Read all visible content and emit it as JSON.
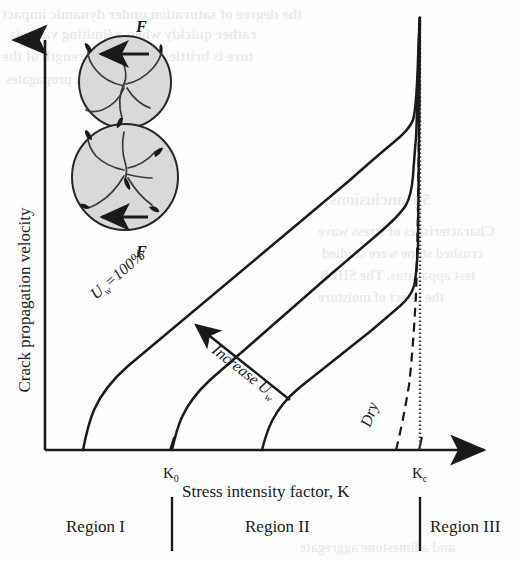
{
  "figure": {
    "type": "schematic-plot",
    "axes": {
      "y_label": "Crack propagation velocity",
      "x_label": "Stress intensity factor, K",
      "x_ticks": [
        {
          "id": "K0",
          "label": "K",
          "subscript": "0",
          "x_frac": 0.286
        },
        {
          "id": "Kc",
          "label": "K",
          "subscript": "c",
          "x_frac": 0.843
        }
      ]
    },
    "regions": [
      {
        "id": "region-1",
        "label": "Region I"
      },
      {
        "id": "region-2",
        "label": "Region II"
      },
      {
        "id": "region-3",
        "label": "Region III"
      }
    ],
    "curve_labels": {
      "saturated": "U",
      "saturated_sub": "w",
      "saturated_value": "=100%",
      "increase": "Increase U",
      "increase_sub": "w",
      "dry": "Dry"
    },
    "inset": {
      "force_top": "F",
      "force_bottom": "F",
      "description": "two grains in contact with radial cracks",
      "grain_fill": "#d9d9d9",
      "grain_stroke": "#262626"
    },
    "colors": {
      "ink": "#1a1a1a",
      "grain_fill": "#d9d9d9",
      "bleed": "#8b8b8b"
    }
  },
  "chart_data": {
    "type": "line",
    "title": "",
    "xlabel": "Stress intensity factor, K",
    "ylabel": "Crack propagation velocity",
    "xlim": [
      0,
      1
    ],
    "ylim": [
      0,
      1
    ],
    "grid": false,
    "legend": "inline-annotations",
    "xticks": [
      "K₀",
      "Kᴄ"
    ],
    "annotations": [
      {
        "text": "U_w =100%",
        "kind": "curve-label",
        "rotation": -45
      },
      {
        "text": "Increase U_w",
        "kind": "arrow-label",
        "rotation": 45
      },
      {
        "text": "Dry",
        "kind": "curve-label",
        "rotation": -68
      },
      {
        "text": "Region I",
        "kind": "region"
      },
      {
        "text": "Region II",
        "kind": "region"
      },
      {
        "text": "Region III",
        "kind": "region"
      }
    ],
    "asymptote": {
      "id": "Kc",
      "x_frac": 0.843,
      "style": "dotted"
    },
    "series": [
      {
        "name": "U_w = 100%",
        "style": "solid",
        "points": [
          [
            0.074,
            0.0
          ],
          [
            0.082,
            0.06
          ],
          [
            0.098,
            0.13
          ],
          [
            0.125,
            0.2
          ],
          [
            0.3,
            0.4
          ],
          [
            0.5,
            0.58
          ],
          [
            0.66,
            0.72
          ],
          [
            0.745,
            0.79
          ],
          [
            0.79,
            0.815
          ],
          [
            0.815,
            0.835
          ],
          [
            0.835,
            0.9
          ],
          [
            0.843,
            0.99
          ]
        ]
      },
      {
        "name": "intermediate saturation",
        "style": "solid",
        "points": [
          [
            0.286,
            0.0
          ],
          [
            0.295,
            0.05
          ],
          [
            0.312,
            0.11
          ],
          [
            0.345,
            0.175
          ],
          [
            0.5,
            0.32
          ],
          [
            0.64,
            0.45
          ],
          [
            0.75,
            0.545
          ],
          [
            0.8,
            0.585
          ],
          [
            0.826,
            0.6
          ],
          [
            0.838,
            0.66
          ],
          [
            0.843,
            0.99
          ]
        ]
      },
      {
        "name": "low saturation",
        "style": "solid",
        "points": [
          [
            0.462,
            0.0
          ],
          [
            0.472,
            0.045
          ],
          [
            0.492,
            0.1
          ],
          [
            0.535,
            0.165
          ],
          [
            0.655,
            0.255
          ],
          [
            0.745,
            0.315
          ],
          [
            0.795,
            0.345
          ],
          [
            0.822,
            0.37
          ],
          [
            0.836,
            0.5
          ],
          [
            0.843,
            0.99
          ]
        ]
      },
      {
        "name": "Dry",
        "style": "dashed",
        "points": [
          [
            0.745,
            0.0
          ],
          [
            0.775,
            0.1
          ],
          [
            0.8,
            0.22
          ],
          [
            0.818,
            0.38
          ],
          [
            0.83,
            0.56
          ],
          [
            0.838,
            0.78
          ],
          [
            0.842,
            0.99
          ]
        ]
      }
    ]
  },
  "background_text": {
    "note": "faint mirrored bleed-through from reverse page",
    "lines": [
      {
        "text": "the degree of saturation under dynamic impact",
        "x": 2,
        "y": 6,
        "size": 15
      },
      {
        "text": "rather quickly when a limiting value is",
        "x": 10,
        "y": 26,
        "size": 15
      },
      {
        "text": "ture is brittle. The shear strength of the",
        "x": 2,
        "y": 48,
        "size": 15
      },
      {
        "text": "in and the crack propagates",
        "x": 6,
        "y": 72,
        "size": 14
      },
      {
        "text": "5 Conclusions",
        "x": 330,
        "y": 190,
        "size": 17
      },
      {
        "text": "Characteristics of stress wave",
        "x": 318,
        "y": 224,
        "size": 14
      },
      {
        "text": "crushed stone were studied",
        "x": 322,
        "y": 246,
        "size": 14
      },
      {
        "text": "test apparatus. The SHPB",
        "x": 320,
        "y": 268,
        "size": 14
      },
      {
        "text": "the effect of moisture",
        "x": 318,
        "y": 290,
        "size": 14
      },
      {
        "text": "and a limestone aggregate",
        "x": 300,
        "y": 540,
        "size": 14
      }
    ]
  }
}
